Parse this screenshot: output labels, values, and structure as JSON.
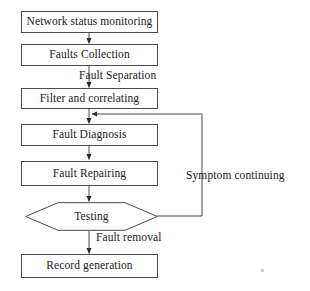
{
  "diagram": {
    "stroke_color": "#4a4a4a",
    "text_color": "#1a1a1a",
    "background_color": "#ffffff",
    "nodes": [
      {
        "id": "network-status-monitoring",
        "shape": "process",
        "label": "Network status monitoring"
      },
      {
        "id": "faults-collection",
        "shape": "process",
        "label": "Faults Collection"
      },
      {
        "id": "filter-and-correlating",
        "shape": "process",
        "label": "Filter and correlating"
      },
      {
        "id": "fault-diagnosis",
        "shape": "process",
        "label": "Fault Diagnosis"
      },
      {
        "id": "fault-repairing",
        "shape": "process",
        "label": "Fault Repairing"
      },
      {
        "id": "testing",
        "shape": "decision",
        "label": "Testing"
      },
      {
        "id": "record-generation",
        "shape": "process",
        "label": "Record generation"
      }
    ],
    "edge_labels": [
      {
        "id": "fault-separation",
        "label": "Fault Separation",
        "from": "faults-collection",
        "to": "filter-and-correlating"
      },
      {
        "id": "symptom-continuing",
        "label": "Symptom continuing",
        "from": "testing",
        "to": "fault-diagnosis"
      },
      {
        "id": "fault-removal",
        "label": "Fault removal",
        "from": "testing",
        "to": "record-generation"
      }
    ],
    "edges": [
      {
        "from": "network-status-monitoring",
        "to": "faults-collection",
        "label": ""
      },
      {
        "from": "faults-collection",
        "to": "filter-and-correlating",
        "label": "Fault Separation"
      },
      {
        "from": "filter-and-correlating",
        "to": "fault-diagnosis",
        "label": ""
      },
      {
        "from": "fault-diagnosis",
        "to": "fault-repairing",
        "label": ""
      },
      {
        "from": "fault-repairing",
        "to": "testing",
        "label": ""
      },
      {
        "from": "testing",
        "to": "record-generation",
        "label": "Fault removal"
      },
      {
        "from": "testing",
        "to": "fault-diagnosis",
        "label": "Symptom continuing"
      }
    ]
  }
}
